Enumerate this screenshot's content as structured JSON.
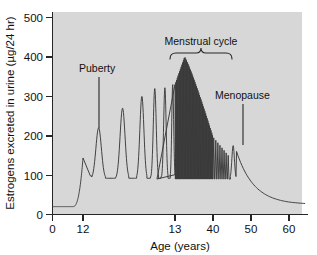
{
  "chart_data": {
    "type": "line",
    "title": "",
    "xlabel": "Age (years)",
    "ylabel": "Estrogens excreted in urine (µg/24 hr)",
    "ylim": [
      0,
      500
    ],
    "yticks": [
      0,
      100,
      200,
      300,
      400,
      500
    ],
    "ytick_labels": [
      "0",
      "100",
      "200",
      "300",
      "400",
      "500"
    ],
    "xticks": [
      0,
      12,
      13,
      40,
      50,
      60
    ],
    "xtick_labels": [
      "0",
      "12",
      "13",
      "40",
      "50",
      "60"
    ],
    "x_axis_note": "non-linear: 12-13 interval expanded to show individual cycles",
    "grid": false,
    "legend": false,
    "background": "#d7d7d7",
    "line_color": "#3a3a3a",
    "annotations": [
      {
        "text": "Puberty",
        "x_years": 12.15,
        "y_value": 345,
        "points_to_value": 220
      },
      {
        "text": "Menstrual cycle",
        "x_years": 25,
        "y_value": 455,
        "bracket_from": 15,
        "bracket_to": 38
      },
      {
        "text": "Menopause",
        "x_years": 46,
        "y_value": 300,
        "points_to_value": 175
      }
    ],
    "series": [
      {
        "name": "Estrogen excretion",
        "description": "baseline ~20 µg/24hr in childhood; sharp rise at puberty; cyclic menstrual oscillations between ~90 and peak 320-400 µg/24hr; decline after age 40; post-menopausal fall to ~25 µg/24hr",
        "key_points": [
          {
            "age": 0,
            "value": 20
          },
          {
            "age": 8,
            "value": 20
          },
          {
            "age": 11,
            "value": 55
          },
          {
            "age": 12,
            "value": 140
          },
          {
            "age": 12.2,
            "value": 220
          },
          {
            "age": 12.35,
            "value": 90
          },
          {
            "age": 12.6,
            "value": 270
          },
          {
            "age": 12.75,
            "value": 92
          },
          {
            "age": 12.9,
            "value": 300
          },
          {
            "age": 13.0,
            "value": 95
          },
          {
            "age": 13.1,
            "value": 320
          },
          {
            "age": 13.25,
            "value": 95
          },
          {
            "age": 13.4,
            "value": 325
          },
          {
            "age": 18,
            "value": 395
          },
          {
            "age": 25,
            "value": 400
          },
          {
            "age": 32,
            "value": 340
          },
          {
            "age": 40,
            "value": 250
          },
          {
            "age": 43,
            "value": 190
          },
          {
            "age": 45,
            "value": 175
          },
          {
            "age": 48,
            "value": 95
          },
          {
            "age": 52,
            "value": 55
          },
          {
            "age": 58,
            "value": 32
          },
          {
            "age": 63,
            "value": 25
          }
        ],
        "cycle_peak_max": 400,
        "cycle_trough": 90,
        "childhood_baseline": 20,
        "postmenopause_baseline": 25
      }
    ]
  }
}
